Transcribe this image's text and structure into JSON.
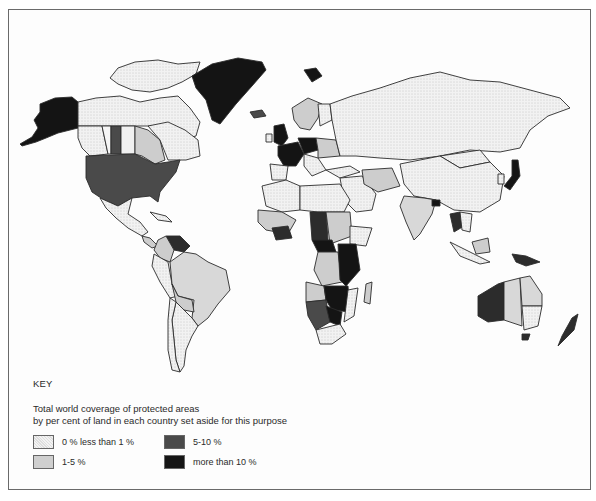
{
  "map": {
    "type": "choropleth world map",
    "subject": "Total world coverage of protected areas"
  },
  "key": {
    "title": "KEY",
    "description_line1": "Total world coverage of protected areas",
    "description_line2": "by per cent of land in each country set aside for this purpose",
    "categories": [
      {
        "label": "0 % less than 1 %",
        "color": "#efefef",
        "pattern": "dotted"
      },
      {
        "label": "1-5 %",
        "color": "#cfcfcf",
        "pattern": "solid"
      },
      {
        "label": "5-10 %",
        "color": "#4a4a4a",
        "pattern": "solid"
      },
      {
        "label": "more than 10 %",
        "color": "#151515",
        "pattern": "solid"
      }
    ]
  },
  "colors": {
    "lt1": "#eeeeee",
    "p1_5": "#cdcdcd",
    "p5_10": "#4a4a4a",
    "gt10": "#141414",
    "border": "#2b2b2b",
    "frame": "#6a6a6a"
  }
}
